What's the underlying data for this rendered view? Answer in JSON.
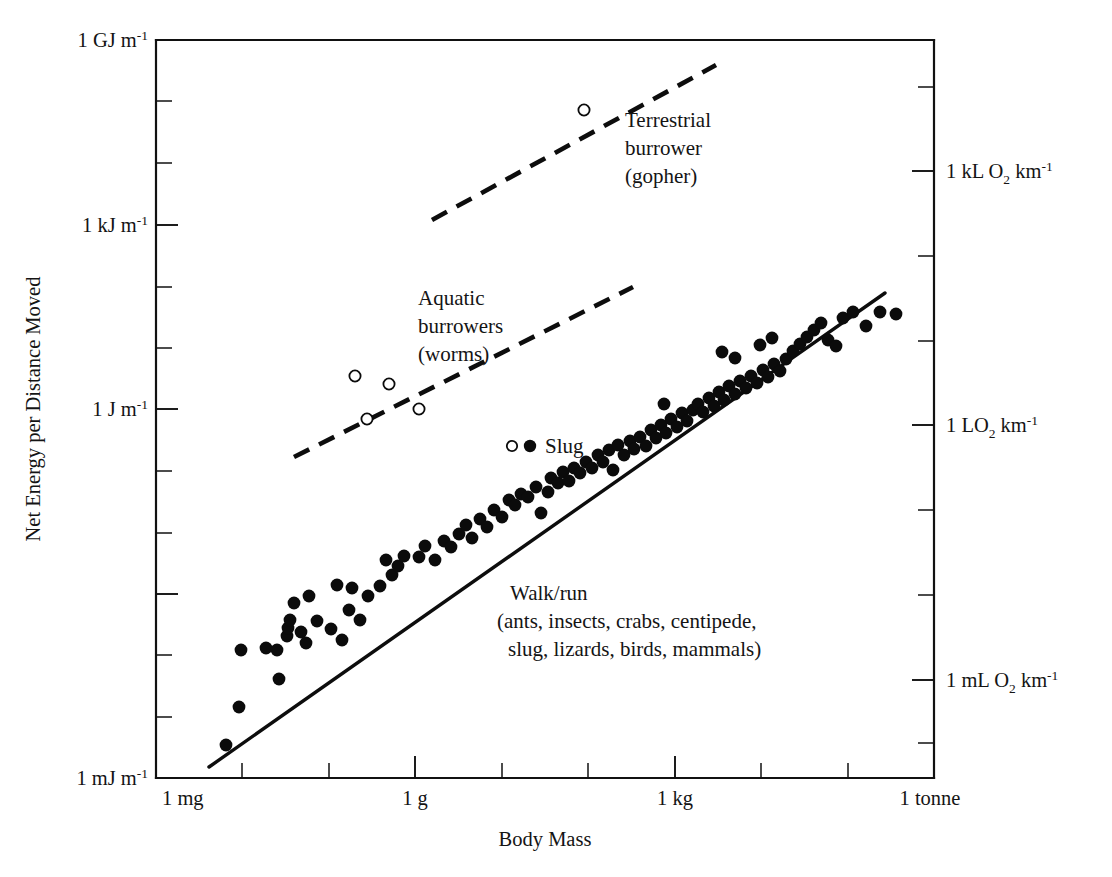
{
  "chart_data": {
    "type": "scatter",
    "title": "",
    "xlabel": "Body Mass",
    "ylabel": "Net Energy per Distance Moved",
    "y2label": "",
    "grid": false,
    "legend_position": "inline-annotations",
    "x_axis": {
      "scale": "log",
      "unit_decades": 9,
      "range_label_min": "1 mg",
      "range_label_max": "1 tonne",
      "major_tick_labels": [
        "1 mg",
        "1 g",
        "1 kg",
        "1 tonne"
      ],
      "major_tick_decade_index": [
        0,
        3,
        6,
        9
      ],
      "minor_ticks_per_decade": 1
    },
    "y_axis_left": {
      "scale": "log",
      "unit_decades": 12,
      "major_tick_labels": [
        "1 GJ m",
        "1 kJ m",
        "1 J m",
        "1 mJ m"
      ],
      "major_tick_exponents": [
        "-1",
        "-1",
        "-1",
        "-1"
      ],
      "major_tick_decade_index": [
        12,
        9,
        6,
        3
      ],
      "labels_full": [
        "1 GJ m⁻¹",
        "1 kJ m⁻¹",
        "1 J m⁻¹",
        "1 mJ m⁻¹"
      ],
      "minor_ticks_per_major": 2
    },
    "y_axis_right": {
      "scale": "log",
      "labels": [
        {
          "prefix": "1 kL O",
          "subscript": "2",
          "suffix": " km",
          "exponent": "-1",
          "full": "1 kL O₂ km⁻¹",
          "y_px": 171
        },
        {
          "prefix": "1 LO",
          "subscript": "2",
          "suffix": " km",
          "exponent": "-1",
          "full": "1 LO₂ km⁻¹",
          "y_px": 425
        },
        {
          "prefix": "1 mL O",
          "subscript": "2",
          "suffix": " km",
          "exponent": "-1",
          "full": "1 mL O₂ km⁻¹",
          "y_px": 680
        }
      ],
      "minor_ticks_per_major": 2
    },
    "annotations": [
      {
        "id": "terrestrial-burrower",
        "lines": [
          "Terrestrial",
          "burrower",
          "(gopher)"
        ],
        "x_px": 625,
        "y_px": 127,
        "marker": "open-circle",
        "marker_point": {
          "x_decade": 2.55,
          "y_decade": 10.48
        }
      },
      {
        "id": "aquatic-burrowers",
        "lines": [
          "Aquatic",
          "burrowers",
          "(worms)"
        ],
        "x_px": 418,
        "y_px": 305,
        "marker": "dashed-line"
      },
      {
        "id": "slug",
        "lines": [
          "Slug"
        ],
        "x_px": 536,
        "y_px": 450,
        "marker": "open-and-filled-circle"
      },
      {
        "id": "walk-run",
        "lines": [
          "Walk/run",
          "(ants, insects, crabs, centipede,",
          "slug, lizards, birds, mammals)"
        ],
        "x_px": 510,
        "y_px": 600,
        "marker": "solid-line"
      }
    ],
    "series": [
      {
        "name": "Walk/run (ants, insects, crabs, centipede, slug, lizards, birds, mammals)",
        "marker": "filled-circle",
        "points_px": [
          [
            226,
            745
          ],
          [
            239,
            707
          ],
          [
            279,
            679
          ],
          [
            241,
            650
          ],
          [
            266,
            648
          ],
          [
            277,
            650
          ],
          [
            287,
            636
          ],
          [
            288,
            628
          ],
          [
            290,
            620
          ],
          [
            301,
            632
          ],
          [
            306,
            643
          ],
          [
            294,
            603
          ],
          [
            309,
            596
          ],
          [
            317,
            621
          ],
          [
            331,
            629
          ],
          [
            342,
            640
          ],
          [
            349,
            610
          ],
          [
            360,
            620
          ],
          [
            337,
            585
          ],
          [
            352,
            588
          ],
          [
            368,
            596
          ],
          [
            380,
            586
          ],
          [
            392,
            575
          ],
          [
            398,
            566
          ],
          [
            386,
            560
          ],
          [
            404,
            556
          ],
          [
            419,
            557
          ],
          [
            425,
            546
          ],
          [
            435,
            560
          ],
          [
            444,
            541
          ],
          [
            451,
            547
          ],
          [
            459,
            534
          ],
          [
            466,
            525
          ],
          [
            472,
            538
          ],
          [
            480,
            519
          ],
          [
            487,
            527
          ],
          [
            494,
            510
          ],
          [
            502,
            517
          ],
          [
            509,
            500
          ],
          [
            515,
            505
          ],
          [
            521,
            494
          ],
          [
            528,
            497
          ],
          [
            536,
            487
          ],
          [
            541,
            513
          ],
          [
            548,
            492
          ],
          [
            551,
            478
          ],
          [
            558,
            483
          ],
          [
            563,
            472
          ],
          [
            569,
            481
          ],
          [
            574,
            468
          ],
          [
            580,
            473
          ],
          [
            586,
            462
          ],
          [
            592,
            468
          ],
          [
            598,
            455
          ],
          [
            603,
            462
          ],
          [
            609,
            450
          ],
          [
            613,
            470
          ],
          [
            618,
            445
          ],
          [
            624,
            455
          ],
          [
            630,
            441
          ],
          [
            634,
            449
          ],
          [
            640,
            437
          ],
          [
            646,
            446
          ],
          [
            651,
            430
          ],
          [
            656,
            438
          ],
          [
            661,
            425
          ],
          [
            666,
            433
          ],
          [
            671,
            419
          ],
          [
            677,
            427
          ],
          [
            682,
            413
          ],
          [
            687,
            421
          ],
          [
            664,
            404
          ],
          [
            693,
            410
          ],
          [
            698,
            404
          ],
          [
            703,
            412
          ],
          [
            709,
            398
          ],
          [
            714,
            406
          ],
          [
            719,
            392
          ],
          [
            724,
            400
          ],
          [
            729,
            386
          ],
          [
            735,
            394
          ],
          [
            740,
            381
          ],
          [
            746,
            388
          ],
          [
            751,
            376
          ],
          [
            757,
            383
          ],
          [
            763,
            370
          ],
          [
            768,
            377
          ],
          [
            774,
            364
          ],
          [
            780,
            371
          ],
          [
            722,
            352
          ],
          [
            735,
            358
          ],
          [
            760,
            345
          ],
          [
            772,
            338
          ],
          [
            786,
            359
          ],
          [
            793,
            351
          ],
          [
            800,
            344
          ],
          [
            807,
            337
          ],
          [
            814,
            330
          ],
          [
            821,
            323
          ],
          [
            828,
            340
          ],
          [
            836,
            346
          ],
          [
            843,
            318
          ],
          [
            853,
            312
          ],
          [
            866,
            326
          ],
          [
            880,
            312
          ],
          [
            896,
            314
          ]
        ],
        "count": 107
      },
      {
        "name": "Aquatic burrowers (worms)",
        "marker": "open-circle",
        "points_px": [
          [
            355,
            376
          ],
          [
            389,
            384
          ],
          [
            419,
            409
          ],
          [
            367,
            419
          ]
        ],
        "count": 4
      },
      {
        "name": "Terrestrial burrower (gopher)",
        "marker": "open-circle",
        "points_px": [
          [
            584,
            110
          ]
        ],
        "count": 1
      }
    ],
    "fit_line": {
      "name": "Walk/run regression",
      "style": "solid",
      "x1_px": 209,
      "y1_px": 767,
      "x2_px": 885,
      "y2_px": 293
    },
    "dashed_lines": [
      {
        "name": "Terrestrial burrower trend",
        "style": "dashed",
        "x1_px": 432,
        "y1_px": 220,
        "x2_px": 716,
        "y2_px": 65
      },
      {
        "name": "Aquatic burrowers trend",
        "style": "dashed",
        "x1_px": 294,
        "y1_px": 457,
        "x2_px": 633,
        "y2_px": 287
      }
    ]
  }
}
